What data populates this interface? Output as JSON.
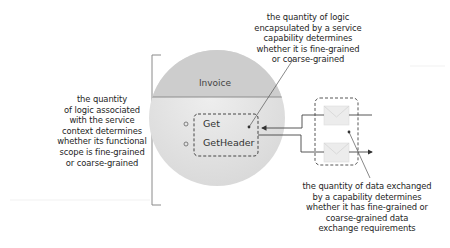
{
  "diagram": {
    "service": {
      "name": "Invoice",
      "capabilities": [
        "Get",
        "GetHeader"
      ]
    },
    "annotations": {
      "left": "the quantity of logic associated with the service context determines whether its functional scope is fine-grained or coarse-grained",
      "top": "the quantity of logic encapsulated by a service capability determines whether it is fine-grained or coarse-grained",
      "bottom": "the quantity of data exchanged by a capability determines whether it has fine-grained or coarse-grained data exchange requirements"
    },
    "annotation_lines": {
      "left": [
        "the quantity",
        "of logic associated",
        "with the service",
        "context determines",
        "whether its functional",
        "scope is fine-grained",
        "or coarse-grained"
      ],
      "top": [
        "the quantity of logic",
        "encapsulated by a service",
        "capability determines",
        "whether it is fine-grained",
        "or coarse-grained"
      ],
      "bottom": [
        "the quantity of data exchanged",
        "by a capability determines",
        "whether it has fine-grained or",
        "coarse-grained data",
        "exchange requirements"
      ]
    },
    "icons": {
      "messages": [
        "envelope-icon",
        "envelope-icon"
      ]
    },
    "colors": {
      "circle_fill": "#e6e6e6",
      "circle_header": "#cfcfcf",
      "line": "#555555",
      "dashed": "#444444",
      "bracket": "#888888"
    }
  }
}
